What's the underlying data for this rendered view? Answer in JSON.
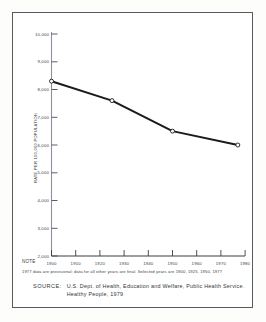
{
  "chart_data": {
    "type": "line",
    "title": "",
    "xlabel": "",
    "ylabel": "RATE PER 100,000 POPULATION",
    "x": [
      1900,
      1925,
      1950,
      1977
    ],
    "values": [
      8300,
      7600,
      6500,
      6000
    ],
    "series": [
      {
        "name": "Death rate",
        "x": [
          1900,
          1925,
          1950,
          1977
        ],
        "values": [
          8300,
          7600,
          6500,
          6000
        ]
      }
    ],
    "xlim": [
      1900,
      1980
    ],
    "ylim": [
      2000,
      10000
    ],
    "xticks": [
      1900,
      1910,
      1920,
      1930,
      1940,
      1950,
      1960,
      1970,
      1980
    ],
    "xticklabels": [
      "1900",
      "1910",
      "1920",
      "1930",
      "1940",
      "1950",
      "1960",
      "1970",
      "1980"
    ],
    "yticks": [
      2000,
      3000,
      4000,
      5000,
      6000,
      7000,
      8000,
      9000,
      10000
    ],
    "yticklabels": [
      "2,000",
      "3,000",
      "4,000",
      "5,000",
      "6,000",
      "7,000",
      "8,000",
      "9,000",
      "10,000"
    ],
    "grid": false,
    "legend": "none",
    "marker": "open-circle",
    "line_color": "#1a1a1a",
    "axis_color": "#6b7074"
  },
  "axis": {
    "y_title": "RATE PER 100,000 POPULATION"
  },
  "note": {
    "label": "NOTE",
    "text": "1977 data are provisional; data for all other years are final. Selected years are 1900, 1925, 1950, 1977"
  },
  "source": {
    "label": "SOURCE:",
    "line1": "U.S. Dept. of Health, Education and Welfare, Public Health Service.",
    "line2": "Healthy People, 1979"
  },
  "colors": {
    "frame": "#555a5e",
    "line": "#1a1a1a",
    "axis": "#6b7074",
    "text": "#33373b",
    "background": "#ffffff"
  }
}
